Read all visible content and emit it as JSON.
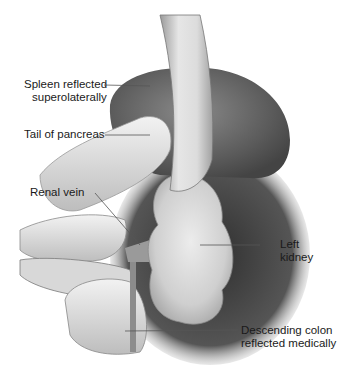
{
  "figure": {
    "labels": {
      "spleen": {
        "line1": "Spleen reflected",
        "line2": "superolaterally"
      },
      "pancreas": {
        "line1": "Tail of pancreas"
      },
      "renal_vein": {
        "line1": "Renal vein"
      },
      "kidney": {
        "line1": "Left",
        "line2": "kidney"
      },
      "colon": {
        "line1": "Descending colon",
        "line2": "reflected medically"
      }
    },
    "colors": {
      "background": "#ffffff",
      "text": "#1a1a1a",
      "leader_line": "#555555",
      "retractor": "#cfcfcf",
      "spleen": "#6a6a6a",
      "kidney": "#d9d9d9",
      "shadow": "#3a3a3a"
    }
  }
}
